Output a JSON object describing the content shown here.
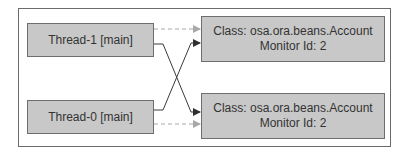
{
  "threads": [
    {
      "id": "thread-1",
      "label": "Thread-1 [main]"
    },
    {
      "id": "thread-0",
      "label": "Thread-0 [main]"
    }
  ],
  "monitors": [
    {
      "class_line": "Class: osa.ora.beans.Account",
      "monitor_line": "Monitor Id: 2"
    },
    {
      "class_line": "Class: osa.ora.beans.Account",
      "monitor_line": "Monitor Id: 2"
    }
  ],
  "edges": [
    {
      "from": "thread-1",
      "to": "monitor-top",
      "style": "dashed",
      "meaning": "holds"
    },
    {
      "from": "thread-1",
      "to": "monitor-bottom",
      "style": "solid",
      "meaning": "waits"
    },
    {
      "from": "thread-0",
      "to": "monitor-bottom",
      "style": "dashed",
      "meaning": "holds"
    },
    {
      "from": "thread-0",
      "to": "monitor-top",
      "style": "solid",
      "meaning": "waits"
    }
  ],
  "colors": {
    "box_fill": "#c8c8c8",
    "box_border": "#6e6e6e",
    "solid_arrow": "#333333",
    "dashed_arrow": "#aaaaaa"
  }
}
